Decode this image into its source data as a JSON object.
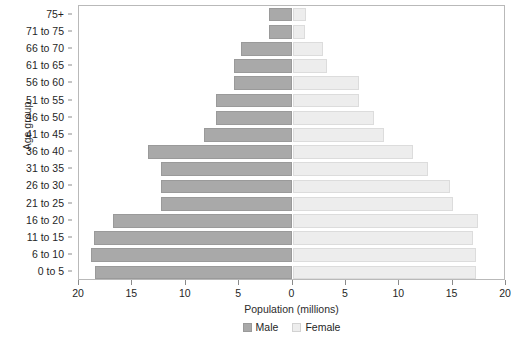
{
  "chart_data": {
    "type": "bar",
    "subtype": "population-pyramid",
    "title": "",
    "xlabel": "Population (millions)",
    "ylabel": "Age group",
    "xlim": [
      -20,
      20
    ],
    "xticks": [
      20,
      15,
      10,
      5,
      0,
      5,
      10,
      15,
      20
    ],
    "grid": false,
    "legend_position": "bottom",
    "categories": [
      "0 to 5",
      "6 to 10",
      "11 to 15",
      "16 to 20",
      "21 to 25",
      "26 to 30",
      "31 to 35",
      "36 to 40",
      "41 to 45",
      "46 to 50",
      "51 to 55",
      "56 to 60",
      "61 to 65",
      "66 to 70",
      "71 to 75",
      "75+"
    ],
    "series": [
      {
        "name": "Male",
        "color": "#a9a9a9",
        "direction": "left",
        "values": [
          18.5,
          18.9,
          18.6,
          16.8,
          12.3,
          12.3,
          12.3,
          13.5,
          8.3,
          7.2,
          7.2,
          5.5,
          5.5,
          4.8,
          2.2,
          2.2
        ]
      },
      {
        "name": "Female",
        "color": "#ededed",
        "direction": "right",
        "values": [
          17.2,
          17.2,
          16.9,
          17.4,
          15.0,
          14.8,
          12.7,
          11.3,
          8.6,
          7.6,
          6.2,
          6.2,
          3.2,
          2.9,
          1.2,
          1.3
        ]
      }
    ]
  },
  "axis": {
    "y_title": "Age group",
    "x_title": "Population (millions)"
  },
  "legend": {
    "entries": [
      {
        "label": "Male",
        "swatch": "male-swatch"
      },
      {
        "label": "Female",
        "swatch": "female-swatch"
      }
    ]
  }
}
